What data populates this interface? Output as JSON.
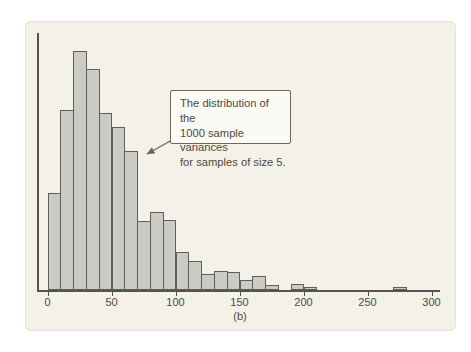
{
  "figure": {
    "caption": "(b)",
    "annotation": {
      "lines": [
        "The distribution of the",
        "1000 sample variances",
        "for samples of size 5."
      ]
    }
  },
  "chart_data": {
    "type": "bar",
    "subtype": "histogram",
    "title": "",
    "xlabel": "",
    "ylabel": "",
    "x_ticks": [
      0,
      50,
      100,
      150,
      200,
      250,
      300
    ],
    "x_range": [
      0,
      310
    ],
    "y_axis_labels_shown": false,
    "grid": false,
    "bin_width": 10,
    "bin_starts": [
      0,
      10,
      20,
      30,
      40,
      50,
      60,
      70,
      80,
      90,
      100,
      110,
      120,
      130,
      140,
      150,
      160,
      170,
      180,
      190,
      200,
      210,
      220,
      230,
      240,
      250,
      260,
      270,
      280,
      290
    ],
    "counts": [
      61,
      113,
      150,
      139,
      111,
      102,
      87,
      43,
      49,
      44,
      24,
      18,
      10,
      12,
      11,
      6,
      9,
      3,
      0,
      4,
      2,
      0,
      0,
      0,
      0,
      0,
      0,
      2,
      0,
      0
    ],
    "max_count": 150,
    "total_samples": 1000,
    "annotation": "The distribution of the 1000 sample variances for samples of size 5.",
    "caption": "(b)"
  },
  "colors": {
    "page_bg": "#ffffff",
    "panel_bg": "#f4f1e8",
    "panel_border": "#e7e3d5",
    "bar_fill": "#cbcbc6",
    "bar_border": "#5f5f59",
    "axis": "#55534b",
    "text": "#4c4a42",
    "callout_bg": "#fbfaf4",
    "callout_border": "#6a685f"
  }
}
